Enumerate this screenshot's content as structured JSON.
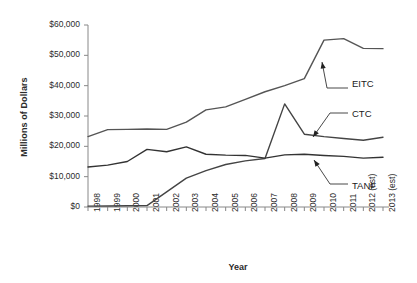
{
  "chart_data": {
    "type": "line",
    "title": "",
    "xlabel": "Year",
    "ylabel": "Millions of Dollars",
    "ylim": [
      0,
      60000
    ],
    "grid": false,
    "legend_position": "inline-annotations",
    "ytick_labels": [
      "$60,000",
      "$50,000",
      "$40,000",
      "$30,000",
      "$20,000",
      "$10,000",
      "$0"
    ],
    "ytick_values": [
      60000,
      50000,
      40000,
      30000,
      20000,
      10000,
      0
    ],
    "categories": [
      "1998",
      "1999",
      "2000",
      "2001",
      "2002",
      "2003",
      "2004",
      "2005",
      "2006",
      "2007",
      "2008",
      "2009",
      "2010",
      "2011",
      "2012 (est)",
      "2013 (est)"
    ],
    "series": [
      {
        "name": "EITC",
        "color": "#555555",
        "values": [
          23200,
          25500,
          25600,
          25700,
          25600,
          28000,
          32000,
          33000,
          35500,
          38000,
          40000,
          42300,
          55000,
          55500,
          52300,
          52200
        ]
      },
      {
        "name": "CTC",
        "color": "#444444",
        "values": [
          300,
          350,
          400,
          450,
          5000,
          9500,
          12000,
          14000,
          15200,
          16000,
          34000,
          24000,
          23200,
          22600,
          22000,
          23000
        ]
      },
      {
        "name": "TANF",
        "color": "#333333",
        "values": [
          13200,
          13800,
          15000,
          19000,
          18200,
          19800,
          17400,
          17100,
          17000,
          16100,
          17200,
          17400,
          17000,
          16700,
          16100,
          16400
        ]
      }
    ],
    "annotations": [
      {
        "label": "EITC",
        "points_to_series": "EITC",
        "points_to_category": "2010"
      },
      {
        "label": "CTC",
        "points_to_series": "CTC",
        "points_to_category": "2009"
      },
      {
        "label": "TANF",
        "points_to_series": "TANF",
        "points_to_category": "2009"
      }
    ]
  }
}
